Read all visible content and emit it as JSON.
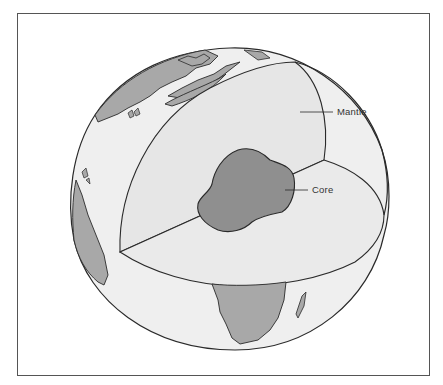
{
  "diagram": {
    "labels": {
      "mantle": "Mantle",
      "core": "Core"
    },
    "colors": {
      "ocean": "#efefef",
      "land": "#a8a8a8",
      "mantle": "#e6e6e6",
      "mantle_top": "#eaeaea",
      "core": "#8f8f8f",
      "outline": "#2a2a2a",
      "frame": "#555555"
    }
  }
}
